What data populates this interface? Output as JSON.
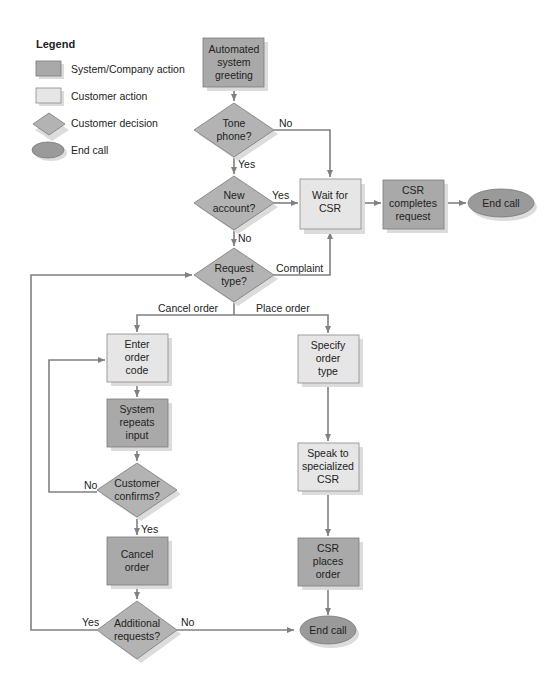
{
  "colors": {
    "system_fill": "#a9a9a9",
    "customer_fill": "#e6e6e6",
    "decision_fill": "#b3b3b3",
    "end_fill": "#9a9a9a",
    "stroke": "#7a7a7a",
    "shadow": "#dcdcdc",
    "line": "#808080",
    "text": "#222222"
  },
  "legend": {
    "title": "Legend",
    "items": [
      {
        "shape": "rect-dark",
        "label": "System/Company action"
      },
      {
        "shape": "rect-light",
        "label": "Customer action"
      },
      {
        "shape": "diamond",
        "label": "Customer decision"
      },
      {
        "shape": "ellipse",
        "label": "End call"
      }
    ]
  },
  "nodes": {
    "greeting": {
      "type": "system",
      "lines": [
        "Automated",
        "system",
        "greeting"
      ]
    },
    "tone_phone": {
      "type": "decision",
      "lines": [
        "Tone",
        "phone?"
      ]
    },
    "new_account": {
      "type": "decision",
      "lines": [
        "New",
        "account?"
      ]
    },
    "wait_csr": {
      "type": "customer",
      "lines": [
        "Wait for",
        "CSR"
      ]
    },
    "csr_completes": {
      "type": "system",
      "lines": [
        "CSR",
        "completes",
        "request"
      ]
    },
    "end_call_top": {
      "type": "end",
      "lines": [
        "End call"
      ]
    },
    "request_type": {
      "type": "decision",
      "lines": [
        "Request",
        "type?"
      ]
    },
    "enter_code": {
      "type": "customer",
      "lines": [
        "Enter",
        "order",
        "code"
      ]
    },
    "system_repeats": {
      "type": "system",
      "lines": [
        "System",
        "repeats",
        "input"
      ]
    },
    "customer_confirms": {
      "type": "decision",
      "lines": [
        "Customer",
        "confirms?"
      ]
    },
    "cancel_order": {
      "type": "system",
      "lines": [
        "Cancel",
        "order"
      ]
    },
    "additional": {
      "type": "decision",
      "lines": [
        "Additional",
        "requests?"
      ]
    },
    "specify_type": {
      "type": "customer",
      "lines": [
        "Specify",
        "order",
        "type"
      ]
    },
    "speak_csr": {
      "type": "customer",
      "lines": [
        "Speak to",
        "specialized",
        "CSR"
      ]
    },
    "csr_places": {
      "type": "system",
      "lines": [
        "CSR",
        "places",
        "order"
      ]
    },
    "end_call_bottom": {
      "type": "end",
      "lines": [
        "End call"
      ]
    }
  },
  "edge_labels": {
    "tone_no": "No",
    "tone_yes": "Yes",
    "new_yes": "Yes",
    "new_no": "No",
    "complaint": "Complaint",
    "cancel_order": "Cancel order",
    "place_order": "Place order",
    "confirm_no": "No",
    "confirm_yes": "Yes",
    "additional_yes": "Yes",
    "additional_no": "No"
  }
}
